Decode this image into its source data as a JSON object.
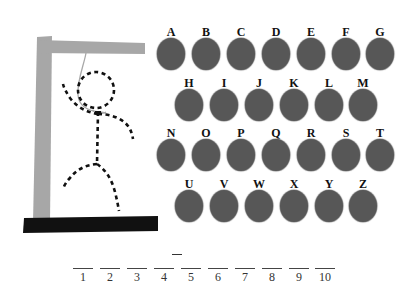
{
  "game": "hangman",
  "colors": {
    "gallows_post": "#a7a7a7",
    "gallows_base": "#111111",
    "letter_disc": "#575757",
    "figure": "#111111",
    "rope": "#a8a8a8"
  },
  "letters": {
    "row1": [
      {
        "label": "A"
      },
      {
        "label": "B"
      },
      {
        "label": "C"
      },
      {
        "label": "D"
      },
      {
        "label": "E"
      },
      {
        "label": "F"
      },
      {
        "label": "G"
      }
    ],
    "row2": [
      {
        "label": "H"
      },
      {
        "label": "I"
      },
      {
        "label": "J"
      },
      {
        "label": "K"
      },
      {
        "label": "L"
      },
      {
        "label": "M"
      }
    ],
    "row3": [
      {
        "label": "N"
      },
      {
        "label": "O"
      },
      {
        "label": "P"
      },
      {
        "label": "Q"
      },
      {
        "label": "R"
      },
      {
        "label": "S"
      },
      {
        "label": "T"
      }
    ],
    "row4": [
      {
        "label": "U"
      },
      {
        "label": "V"
      },
      {
        "label": "W"
      },
      {
        "label": "X"
      },
      {
        "label": "Y"
      },
      {
        "label": "Z"
      }
    ]
  },
  "word_slots": [
    {
      "num": "1"
    },
    {
      "num": "2"
    },
    {
      "num": "3"
    },
    {
      "num": "4"
    },
    {
      "num": "5",
      "mark": "-"
    },
    {
      "num": "6"
    },
    {
      "num": "7"
    },
    {
      "num": "8"
    },
    {
      "num": "9"
    },
    {
      "num": "10"
    }
  ]
}
